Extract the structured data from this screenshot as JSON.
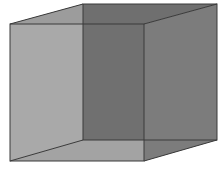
{
  "diagram": {
    "type": "wireframe-cube",
    "colors": {
      "background": "#ffffff",
      "left_face": "#a9a9a9",
      "front_overlap": "#707070",
      "right_face": "#7c7c7c",
      "top_face": "#9c9c9c",
      "bottom_face": "#a3a3a3",
      "edge": "#3a3a3a"
    },
    "vertices": {
      "front_top_left": [
        10,
        24
      ],
      "front_top_right": [
        144,
        24
      ],
      "front_bottom_left": [
        10,
        161
      ],
      "front_bottom_right": [
        144,
        161
      ],
      "back_top_left": [
        83,
        4
      ],
      "back_top_right": [
        217,
        4
      ],
      "back_bottom_left": [
        83,
        140
      ],
      "back_bottom_right": [
        217,
        140
      ]
    }
  }
}
